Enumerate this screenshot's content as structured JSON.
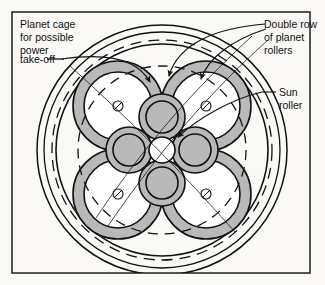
{
  "figure": {
    "background_color": "#faf9f6",
    "frame_color": "#2b2b2b",
    "line_color": "#111111",
    "roller_fill": "#b9b9b9",
    "hub_fill": "#ffffff"
  },
  "labels": {
    "planet_cage": {
      "name": "planet-cage-label",
      "lines": [
        "Planet cage",
        "for possible",
        "power",
        "take-off"
      ],
      "line1": "Planet cage",
      "line2": "for possible",
      "line3": "power",
      "line4": "take-off"
    },
    "double_row": {
      "name": "double-row-label",
      "lines": [
        "Double row",
        "of planet",
        "rollers"
      ],
      "line1": "Double row",
      "line2": "of planet",
      "line3": "rollers"
    },
    "sun_roller": {
      "name": "sun-roller-label",
      "lines": [
        "Sun",
        "roller"
      ],
      "line1": "Sun",
      "line2": "roller"
    }
  },
  "diagram_data": {
    "type": "schematic",
    "center": [
      162,
      150
    ],
    "rings": [
      {
        "name": "outer-housing-ring",
        "radius": 125,
        "style": "solid"
      },
      {
        "name": "housing-inner-ring",
        "radius": 118,
        "style": "solid"
      },
      {
        "name": "planet-cage-circle",
        "radius": 110,
        "style": "dashed"
      },
      {
        "name": "ring-race-outer",
        "radius": 106,
        "style": "solid"
      },
      {
        "name": "cage-pitch-circle",
        "radius": 84,
        "style": "dashed"
      }
    ],
    "sun_roller": {
      "name": "sun-roller",
      "radius": 13,
      "fill": "#ffffff"
    },
    "inner_planet_rollers": {
      "count": 4,
      "orbit_radius": 33,
      "outer_radius": 23,
      "inner_radius": 16,
      "start_angle_deg": 0,
      "fill": "#b9b9b9"
    },
    "outer_planet_rollers": {
      "count": 4,
      "orbit_radius": 62,
      "outer_radius": 45,
      "inner_radius": 34,
      "start_angle_deg": 45,
      "fill": "#b9b9b9",
      "center_mark_radius": 5
    }
  }
}
